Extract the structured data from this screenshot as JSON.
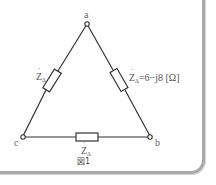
{
  "diagram": {
    "type": "delta-connected load circuit",
    "nodes": {
      "a": "a",
      "b": "b",
      "c": "c"
    },
    "impedances": {
      "left": {
        "symbol": "Z",
        "dot": "˙",
        "subscript": "Δ",
        "value": ""
      },
      "right": {
        "symbol": "Z",
        "dot": "˙",
        "subscript": "Δ",
        "value": "=6−j8 [Ω]"
      },
      "bottom": {
        "symbol": "Z",
        "dot": "˙",
        "subscript": "Δ",
        "value": ""
      }
    },
    "caption": "図1",
    "colors": {
      "line": "#333333",
      "panel_border": "#a8a8a8",
      "text": "#555555"
    }
  }
}
